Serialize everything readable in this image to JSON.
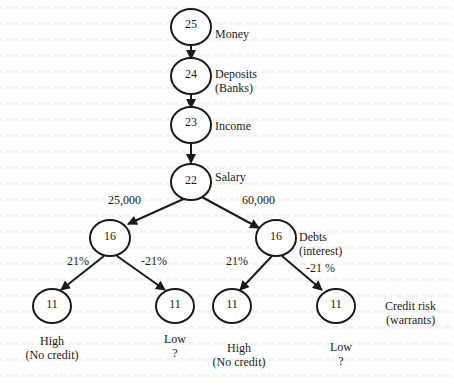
{
  "diagram": {
    "nodes": [
      {
        "id": "n25",
        "value": "25",
        "label": "Money"
      },
      {
        "id": "n24",
        "value": "24",
        "label": "Deposits",
        "sublabel": "(Banks)"
      },
      {
        "id": "n23",
        "value": "23",
        "label": "Income"
      },
      {
        "id": "n22",
        "value": "22",
        "label": "Salary"
      },
      {
        "id": "n16a",
        "value": "16"
      },
      {
        "id": "n16b",
        "value": "16",
        "label": "Debts",
        "sublabel": "(interest)"
      },
      {
        "id": "n11a",
        "value": "11",
        "label": "High",
        "sublabel": "(No credit)"
      },
      {
        "id": "n11b",
        "value": "11",
        "label": "Low",
        "sublabel": "?"
      },
      {
        "id": "n11c",
        "value": "11",
        "label": "High",
        "sublabel": "(No credit)"
      },
      {
        "id": "n11d",
        "value": "11",
        "label": "Low",
        "sublabel": "?"
      }
    ],
    "edges": [
      {
        "from": "n25",
        "to": "n24"
      },
      {
        "from": "n24",
        "to": "n23"
      },
      {
        "from": "n23",
        "to": "n22"
      },
      {
        "from": "n22",
        "to": "n16a",
        "label": "25,000"
      },
      {
        "from": "n22",
        "to": "n16b",
        "label": "60,000"
      },
      {
        "from": "n16a",
        "to": "n11a",
        "label": "21%"
      },
      {
        "from": "n16a",
        "to": "n11b",
        "label": "-21%"
      },
      {
        "from": "n16b",
        "to": "n11c",
        "label": "21%"
      },
      {
        "from": "n16b",
        "to": "n11d",
        "label": "-21 %"
      }
    ],
    "level_label": {
      "line1": "Credit risk",
      "line2": "(warrants)"
    }
  }
}
